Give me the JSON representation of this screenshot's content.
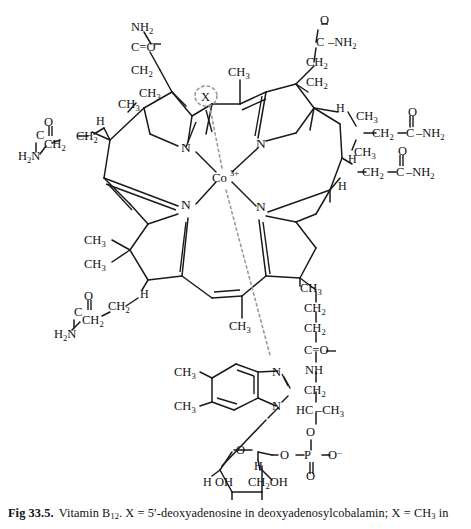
{
  "figure": {
    "metal_center": {
      "label": "Co",
      "charge": "3+"
    },
    "upper_axial_ligand": {
      "label": "X",
      "highlight": "dotted-ellipse"
    },
    "ring_nitrogens": [
      "N",
      "N",
      "N",
      "N"
    ],
    "corrin_substituents": {
      "top_left_ring": {
        "amide_chain": [
          "NH2",
          "C=O",
          "CH2"
        ],
        "methyl": "CH3"
      },
      "top_right_ring": {
        "amide_chain": [
          "O",
          "C",
          "NH2",
          "CH2",
          "CH2"
        ],
        "hydrogen": "H",
        "side_amide": [
          "CH2",
          "C",
          "O",
          "NH2"
        ],
        "methyl": "CH3"
      },
      "left_ring": {
        "amide_chain": [
          "H2N",
          "C",
          "O",
          "CH2",
          "CH2"
        ],
        "hydrogen": "H",
        "methyl": "CH3"
      },
      "right_ring": {
        "hydrogen_top": "H",
        "side_amide": [
          "CH2",
          "C",
          "O",
          "NH2"
        ],
        "hydrogen_mid": "H",
        "methyl": "CH3"
      },
      "bottom_left_ring": {
        "gem_dimethyl": [
          "CH3",
          "CH3"
        ],
        "hydrogen": "H",
        "amide_chain": [
          "CH2",
          "CH2",
          "C",
          "O",
          "H2N"
        ]
      },
      "bottom_right_ring": {
        "methyl": "CH3",
        "propanolamide_chain": [
          "CH2",
          "CH2",
          "C=O",
          "NH",
          "CH2",
          "HC",
          "CH3"
        ]
      },
      "meso_methyls": [
        "CH3",
        "CH3"
      ]
    },
    "nucleotide_loop": {
      "benzimidazole": {
        "name": "5,6-dimethylbenzimidazole",
        "methyls": [
          "CH3",
          "CH3"
        ],
        "nitrogens": [
          "N",
          "N"
        ]
      },
      "phosphate": {
        "atoms": [
          "O",
          "P",
          "O-",
          "O"
        ],
        "linkage_oxygen": "O"
      },
      "ribose": {
        "ring_oxygen": "O",
        "hydrogens": [
          "H",
          "H",
          "H",
          "H"
        ],
        "hydroxyl": "OH",
        "hydroxymethyl": "CH2OH"
      }
    }
  },
  "caption": {
    "figure_number": "Fig 33.5.",
    "text_part1": "Vitamin B",
    "sub1": "12",
    "text_part2": ". X = 5",
    "prime": "′",
    "text_part3": "-deoxyadenosine in deoxyadenosylcobalamin; X = CH",
    "sub2": "3",
    "text_part4": " in"
  },
  "colors": {
    "line": "#1a1a1a",
    "text": "#111111",
    "dotted": "#9a9a9a",
    "background": "#ffffff"
  }
}
